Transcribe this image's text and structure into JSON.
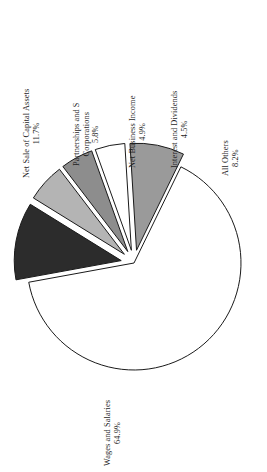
{
  "chart_data": {
    "type": "pie",
    "title": "",
    "orientation": "rotated-90-ccw",
    "categories": [
      "Wages and Salaries",
      "Net Sale of Capital Assets",
      "Partnerships and S Corporations",
      "Net Business Income",
      "Interest and Dividends",
      "All Others"
    ],
    "values": [
      64.9,
      11.7,
      5.8,
      4.9,
      4.5,
      8.2
    ],
    "value_labels": [
      "64.9%",
      "11.7%",
      "5.8%",
      "4.9%",
      "4.5%",
      "8.2%"
    ],
    "unit": "percent",
    "legend": "none",
    "grid": false,
    "slices": [
      {
        "name": "Wages and Salaries",
        "label_lines": [
          "Wages and Salaries"
        ],
        "pct_label": "64.9%",
        "value": 64.9,
        "color": "#ffffff",
        "stroke": "#1a1a1a",
        "exploded": false
      },
      {
        "name": "Net Sale of Capital Assets",
        "label_lines": [
          "Net Sale of Capital Assets"
        ],
        "pct_label": "11.7%",
        "value": 11.7,
        "color": "#2c2c2c",
        "stroke": "#1a1a1a",
        "exploded": true
      },
      {
        "name": "Partnerships and S Corporations",
        "label_lines": [
          "Partnerships and S",
          "Corporations"
        ],
        "pct_label": "5.8%",
        "value": 5.8,
        "color": "#b4b4b4",
        "stroke": "#1a1a1a",
        "exploded": true
      },
      {
        "name": "Net Business Income",
        "label_lines": [
          "Net Business Income"
        ],
        "pct_label": "4.9%",
        "value": 4.9,
        "color": "#8d8d8d",
        "stroke": "#1a1a1a",
        "exploded": true
      },
      {
        "name": "Interest and Dividends",
        "label_lines": [
          "Interest and Dividends"
        ],
        "pct_label": "4.5%",
        "value": 4.5,
        "color": "#ffffff",
        "stroke": "#1a1a1a",
        "exploded": true
      },
      {
        "name": "All Others",
        "label_lines": [
          "All Others"
        ],
        "pct_label": "8.2%",
        "value": 8.2,
        "color": "#9a9a9a",
        "stroke": "#1a1a1a",
        "exploded": true
      }
    ]
  },
  "labels": {
    "net_sale_capital_assets": {
      "line1": "Net Sale of Capital Assets",
      "pct": "11.7%"
    },
    "partnerships": {
      "line1": "Partnerships and S",
      "line2": "Corporations",
      "pct": "5.8%"
    },
    "net_business_income": {
      "line1": "Net Business Income",
      "pct": "4.9%"
    },
    "interest_dividends": {
      "line1": "Interest and Dividends",
      "pct": "4.5%"
    },
    "all_others": {
      "line1": "All Others",
      "pct": "8.2%"
    },
    "wages_salaries": {
      "line1": "Wages and Salaries",
      "pct": "64.9%"
    }
  }
}
